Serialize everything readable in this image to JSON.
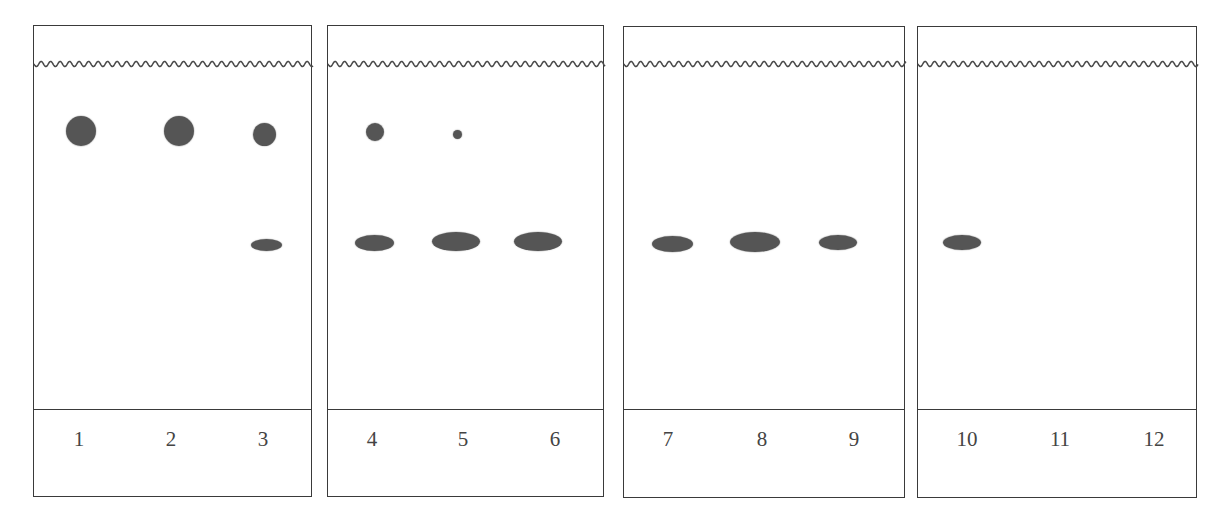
{
  "figure": {
    "stroke_color": "#3a3a3a",
    "spot_color": "#555555",
    "solvent_front_y": 64,
    "divider_y": 409
  },
  "panels": [
    {
      "id": "plate-1",
      "box": {
        "left": 33,
        "top": 25,
        "right": 312,
        "bottom": 497
      },
      "lanes": [
        {
          "label": "1",
          "x": 79
        },
        {
          "label": "2",
          "x": 171
        },
        {
          "label": "3",
          "x": 263
        }
      ]
    },
    {
      "id": "plate-2",
      "box": {
        "left": 327,
        "top": 25,
        "right": 604,
        "bottom": 497
      },
      "lanes": [
        {
          "label": "4",
          "x": 372
        },
        {
          "label": "5",
          "x": 463
        },
        {
          "label": "6",
          "x": 555
        }
      ]
    },
    {
      "id": "plate-3",
      "box": {
        "left": 623,
        "top": 26,
        "right": 905,
        "bottom": 498
      },
      "lanes": [
        {
          "label": "7",
          "x": 668
        },
        {
          "label": "8",
          "x": 762
        },
        {
          "label": "9",
          "x": 854
        }
      ]
    },
    {
      "id": "plate-4",
      "box": {
        "left": 917,
        "top": 26,
        "right": 1197,
        "bottom": 498
      },
      "lanes": [
        {
          "label": "10",
          "x": 967
        },
        {
          "label": "11",
          "x": 1060
        },
        {
          "label": "12",
          "x": 1154
        }
      ]
    }
  ],
  "spots": [
    {
      "lane": "1",
      "band": "upper",
      "cx": 81,
      "cy": 131,
      "w": 30,
      "h": 30
    },
    {
      "lane": "2",
      "band": "upper",
      "cx": 179,
      "cy": 131,
      "w": 30,
      "h": 30
    },
    {
      "lane": "3",
      "band": "upper",
      "cx": 264,
      "cy": 134,
      "w": 23,
      "h": 23
    },
    {
      "lane": "3",
      "band": "lower",
      "cx": 266,
      "cy": 245,
      "w": 31,
      "h": 12
    },
    {
      "lane": "4",
      "band": "upper",
      "cx": 375,
      "cy": 132,
      "w": 18,
      "h": 18
    },
    {
      "lane": "4",
      "band": "lower",
      "cx": 374,
      "cy": 243,
      "w": 39,
      "h": 16
    },
    {
      "lane": "5",
      "band": "upper",
      "cx": 457,
      "cy": 134,
      "w": 9,
      "h": 9
    },
    {
      "lane": "5",
      "band": "lower",
      "cx": 456,
      "cy": 241,
      "w": 48,
      "h": 19
    },
    {
      "lane": "6",
      "band": "lower",
      "cx": 538,
      "cy": 241,
      "w": 48,
      "h": 19
    },
    {
      "lane": "7",
      "band": "lower",
      "cx": 672,
      "cy": 244,
      "w": 41,
      "h": 16
    },
    {
      "lane": "8",
      "band": "lower",
      "cx": 755,
      "cy": 242,
      "w": 50,
      "h": 20
    },
    {
      "lane": "9",
      "band": "lower",
      "cx": 838,
      "cy": 242,
      "w": 38,
      "h": 15
    },
    {
      "lane": "10",
      "band": "lower",
      "cx": 962,
      "cy": 242,
      "w": 38,
      "h": 15
    }
  ],
  "lane_labels": [
    "1",
    "2",
    "3",
    "4",
    "5",
    "6",
    "7",
    "8",
    "9",
    "10",
    "11",
    "12"
  ]
}
